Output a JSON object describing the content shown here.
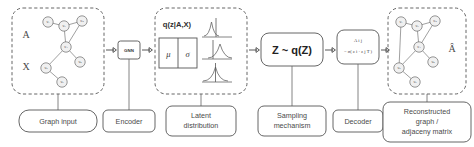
{
  "diagram": {
    "background_color": "#ffffff",
    "line_color": "#555555",
    "node_fill": "#f0f0f0"
  },
  "stages": [
    {
      "id": "graph-input",
      "label": "Graph input",
      "symbols": [
        "A",
        "X"
      ],
      "box_style": "dashed"
    },
    {
      "id": "encoder",
      "label": "Encoder",
      "box_text": "GNN",
      "box_style": "solid"
    },
    {
      "id": "latent-distribution",
      "label": "Latent distribution",
      "label_line1": "Latent",
      "label_line2": "distribution",
      "title": "q(z|A,X)",
      "params": [
        "μ",
        "σ"
      ],
      "box_style": "dashed",
      "distribution_count": 3
    },
    {
      "id": "sampling-mechanism",
      "label": "Sampling mechanism",
      "label_line1": "Sampling",
      "label_line2": "mechanism",
      "box_text": "Z ~ q(Z)",
      "box_style": "solid"
    },
    {
      "id": "decoder",
      "label": "Decoder",
      "formula_line1": "A i j",
      "formula_line2": "= σ( z i · z j T )",
      "box_style": "solid"
    },
    {
      "id": "reconstructed-graph",
      "label": "Reconstructed graph / adjaceny matrix",
      "label_line1": "Reconstructed",
      "label_line2": "graph  /",
      "label_line3": "adjaceny matrix",
      "symbols": [
        "Â"
      ],
      "box_style": "dashed"
    }
  ],
  "input_graph": {
    "nodes": [
      {
        "id": "v1",
        "label": "v₁",
        "x": 48,
        "y": 22
      },
      {
        "id": "v2",
        "label": "v₂",
        "x": 64,
        "y": 26
      },
      {
        "id": "v3",
        "label": "v₃",
        "x": 82,
        "y": 21
      },
      {
        "id": "v4",
        "label": "v₄",
        "x": 66,
        "y": 47
      },
      {
        "id": "v5",
        "label": "v₅",
        "x": 80,
        "y": 62
      },
      {
        "id": "v6",
        "label": "v₆",
        "x": 46,
        "y": 68
      },
      {
        "id": "v7",
        "label": "v₇",
        "x": 62,
        "y": 82
      }
    ],
    "edges": [
      [
        "v1",
        "v2"
      ],
      [
        "v2",
        "v3"
      ],
      [
        "v2",
        "v4"
      ],
      [
        "v3",
        "v4"
      ],
      [
        "v4",
        "v5"
      ],
      [
        "v4",
        "v6"
      ],
      [
        "v6",
        "v7"
      ]
    ]
  },
  "output_graph": {
    "nodes": [
      {
        "id": "v1",
        "label": "v₁",
        "x": 401,
        "y": 22
      },
      {
        "id": "v2",
        "label": "v₂",
        "x": 417,
        "y": 26
      },
      {
        "id": "v3",
        "label": "v₃",
        "x": 435,
        "y": 21
      },
      {
        "id": "v4",
        "label": "v₄",
        "x": 419,
        "y": 47
      },
      {
        "id": "v5",
        "label": "v₅",
        "x": 433,
        "y": 62
      },
      {
        "id": "v6",
        "label": "v₆",
        "x": 399,
        "y": 68
      },
      {
        "id": "v7",
        "label": "v₇",
        "x": 415,
        "y": 82
      }
    ],
    "edges": [
      [
        "v1",
        "v2"
      ],
      [
        "v2",
        "v3"
      ],
      [
        "v2",
        "v4"
      ],
      [
        "v3",
        "v4"
      ],
      [
        "v4",
        "v5"
      ],
      [
        "v4",
        "v6"
      ],
      [
        "v6",
        "v7"
      ],
      [
        "v1",
        "v6"
      ]
    ]
  },
  "distributions": [
    {
      "index": 1,
      "mean_offset": 0.42,
      "spread": "narrow",
      "marker_at": 0.55
    },
    {
      "index": 2,
      "mean_offset": 0.62,
      "spread": "medium",
      "marker_at": 0.38
    },
    {
      "index": 3,
      "mean_offset": 0.5,
      "spread": "wide",
      "marker_at": 0.5
    }
  ],
  "arrows": [
    {
      "from": "graph-input",
      "to": "encoder"
    },
    {
      "from": "encoder",
      "to": "latent-distribution"
    },
    {
      "from": "latent-distribution",
      "to": "sampling-mechanism"
    },
    {
      "from": "sampling-mechanism",
      "to": "decoder"
    },
    {
      "from": "decoder",
      "to": "reconstructed-graph"
    }
  ]
}
